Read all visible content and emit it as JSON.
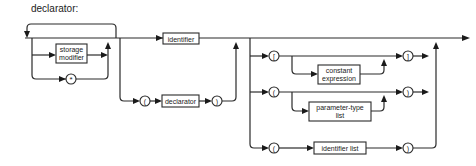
{
  "title": "declarator:",
  "nonterminals": {
    "storage_modifier": [
      "storage",
      "modifier"
    ],
    "identifier": "identifier",
    "declarator": "declarator",
    "constant_expression": [
      "constant",
      "expression"
    ],
    "parameter_type_list": [
      "parameter-type",
      "list"
    ],
    "identifier_list": "identifier list"
  },
  "terminals": {
    "star": "*",
    "lparen_group": "(",
    "rparen_group": ")",
    "lbracket": "[",
    "rbracket": "]",
    "lparen_params": "(",
    "rparen_params": ")",
    "lparen_ids": "(",
    "rparen_ids": ")"
  }
}
